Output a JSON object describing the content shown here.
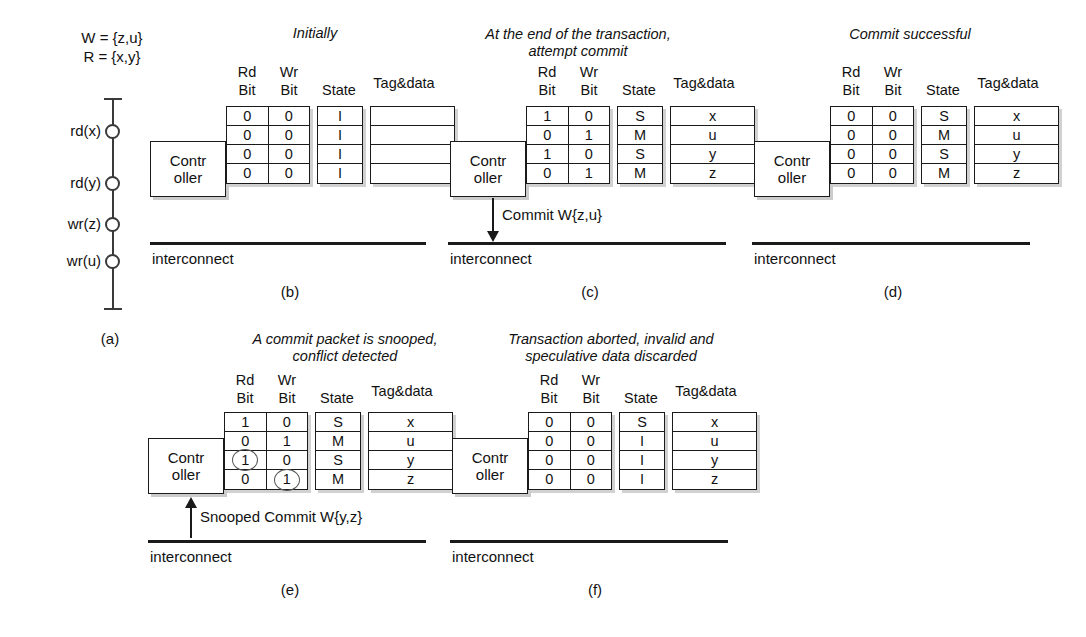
{
  "figure": {
    "panel_labels": [
      "(a)",
      "(b)",
      "(c)",
      "(d)",
      "(e)",
      "(f)"
    ],
    "bus_label": "interconnect",
    "controller_line1": "Contr",
    "controller_line2": "oller",
    "column_headers": {
      "rd1": "Rd",
      "rd2": "Bit",
      "wr1": "Wr",
      "wr2": "Bit",
      "state": "State",
      "tag": "Tag&data"
    }
  },
  "panel_a": {
    "caption": "(a)",
    "write_set": "W = {z,u}",
    "read_set": "R = {x,y}",
    "events": [
      "rd(x)",
      "rd(y)",
      "wr(z)",
      "wr(u)"
    ]
  },
  "panel_b": {
    "caption": "(b)",
    "title_line1": "Initially",
    "title_line2": "",
    "rows": [
      {
        "rd": "0",
        "wr": "0",
        "state": "I",
        "tag": "",
        "rd_circled": false,
        "wr_circled": false
      },
      {
        "rd": "0",
        "wr": "0",
        "state": "I",
        "tag": "",
        "rd_circled": false,
        "wr_circled": false
      },
      {
        "rd": "0",
        "wr": "0",
        "state": "I",
        "tag": "",
        "rd_circled": false,
        "wr_circled": false
      },
      {
        "rd": "0",
        "wr": "0",
        "state": "I",
        "tag": "",
        "rd_circled": false,
        "wr_circled": false
      }
    ]
  },
  "panel_c": {
    "caption": "(c)",
    "title_line1": "At the end of the transaction,",
    "title_line2": "attempt commit",
    "arrow_label": "Commit W{z,u}",
    "arrow_direction": "down",
    "rows": [
      {
        "rd": "1",
        "wr": "0",
        "state": "S",
        "tag": "x",
        "rd_circled": false,
        "wr_circled": false
      },
      {
        "rd": "0",
        "wr": "1",
        "state": "M",
        "tag": "u",
        "rd_circled": false,
        "wr_circled": false
      },
      {
        "rd": "1",
        "wr": "0",
        "state": "S",
        "tag": "y",
        "rd_circled": false,
        "wr_circled": false
      },
      {
        "rd": "0",
        "wr": "1",
        "state": "M",
        "tag": "z",
        "rd_circled": false,
        "wr_circled": false
      }
    ]
  },
  "panel_d": {
    "caption": "(d)",
    "title_line1": "Commit successful",
    "title_line2": "",
    "rows": [
      {
        "rd": "0",
        "wr": "0",
        "state": "S",
        "tag": "x",
        "rd_circled": false,
        "wr_circled": false
      },
      {
        "rd": "0",
        "wr": "0",
        "state": "M",
        "tag": "u",
        "rd_circled": false,
        "wr_circled": false
      },
      {
        "rd": "0",
        "wr": "0",
        "state": "S",
        "tag": "y",
        "rd_circled": false,
        "wr_circled": false
      },
      {
        "rd": "0",
        "wr": "0",
        "state": "M",
        "tag": "z",
        "rd_circled": false,
        "wr_circled": false
      }
    ]
  },
  "panel_e": {
    "caption": "(e)",
    "title_line1": "A commit packet is snooped,",
    "title_line2": "conflict detected",
    "arrow_label": "Snooped Commit W{y,z}",
    "arrow_direction": "up",
    "rows": [
      {
        "rd": "1",
        "wr": "0",
        "state": "S",
        "tag": "x",
        "rd_circled": false,
        "wr_circled": false
      },
      {
        "rd": "0",
        "wr": "1",
        "state": "M",
        "tag": "u",
        "rd_circled": false,
        "wr_circled": false
      },
      {
        "rd": "1",
        "wr": "0",
        "state": "S",
        "tag": "y",
        "rd_circled": true,
        "wr_circled": false
      },
      {
        "rd": "0",
        "wr": "1",
        "state": "M",
        "tag": "z",
        "rd_circled": false,
        "wr_circled": true
      }
    ]
  },
  "panel_f": {
    "caption": "(f)",
    "title_line1": "Transaction aborted, invalid and",
    "title_line2": "speculative data discarded",
    "rows": [
      {
        "rd": "0",
        "wr": "0",
        "state": "S",
        "tag": "x",
        "rd_circled": false,
        "wr_circled": false
      },
      {
        "rd": "0",
        "wr": "0",
        "state": "I",
        "tag": "u",
        "rd_circled": false,
        "wr_circled": false
      },
      {
        "rd": "0",
        "wr": "0",
        "state": "I",
        "tag": "y",
        "rd_circled": false,
        "wr_circled": false
      },
      {
        "rd": "0",
        "wr": "0",
        "state": "I",
        "tag": "z",
        "rd_circled": false,
        "wr_circled": false
      }
    ]
  }
}
